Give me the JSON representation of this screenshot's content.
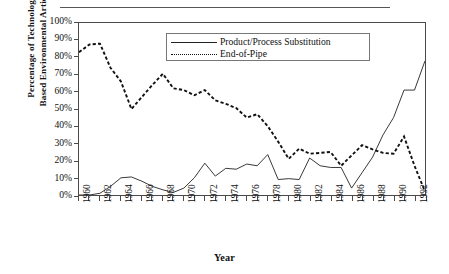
{
  "figure": {
    "top_rule": "horizontal-rule",
    "y_axis_title": "Percentage of Technology\nBased Environmental Articles",
    "x_axis_title": "Year"
  },
  "legend": {
    "position": "top-center-inside",
    "entries": [
      {
        "label": "Product/Process Substitution",
        "style": "solid",
        "key": "solid-line-key"
      },
      {
        "label": "End-of-Pipe",
        "style": "dotted",
        "key": "dotted-line-key"
      }
    ]
  },
  "chart_data": {
    "type": "line",
    "title": "",
    "subtitle": "",
    "xlabel": "Year",
    "ylabel": "Percentage of Technology Based Environmental Articles",
    "xlim": [
      1960,
      1993
    ],
    "ylim": [
      0,
      100
    ],
    "grid": false,
    "legend_position": "upper center",
    "ytick_labels": [
      "0%",
      "10%",
      "20%",
      "30%",
      "40%",
      "50%",
      "60%",
      "70%",
      "80%",
      "90%",
      "100%"
    ],
    "ytick_values": [
      0,
      10,
      20,
      30,
      40,
      50,
      60,
      70,
      80,
      90,
      100
    ],
    "xtick_labels": [
      "1960",
      "1962",
      "1964",
      "1966",
      "1968",
      "1970",
      "1972",
      "1974",
      "1976",
      "1978",
      "1980",
      "1982",
      "1984",
      "1986",
      "1988",
      "1990",
      "1992"
    ],
    "xtick_values": [
      1960,
      1962,
      1964,
      1966,
      1968,
      1970,
      1972,
      1974,
      1976,
      1978,
      1980,
      1982,
      1984,
      1986,
      1988,
      1990,
      1992
    ],
    "minor_xticks_every": 1,
    "x": [
      1960,
      1961,
      1962,
      1963,
      1964,
      1965,
      1966,
      1967,
      1968,
      1969,
      1970,
      1971,
      1972,
      1973,
      1974,
      1975,
      1976,
      1977,
      1978,
      1979,
      1980,
      1981,
      1982,
      1983,
      1984,
      1985,
      1986,
      1987,
      1988,
      1989,
      1990,
      1991,
      1992,
      1993
    ],
    "series": [
      {
        "name": "Product/Process Substitution",
        "style": "solid",
        "color": "#222222",
        "values": [
          0,
          0,
          1,
          5,
          10,
          10.5,
          8,
          5,
          3,
          1.5,
          4,
          10,
          18.5,
          11,
          15.5,
          15,
          18,
          17,
          23.5,
          9,
          9.5,
          9,
          21.5,
          17,
          16,
          16,
          4,
          13,
          22,
          35,
          45,
          61,
          61,
          78
        ]
      },
      {
        "name": "End-of-Pipe",
        "style": "dotted",
        "color": "#111111",
        "values": [
          83,
          87.5,
          88,
          74,
          66,
          50,
          57,
          64,
          70.5,
          62,
          61,
          58,
          61,
          55,
          53,
          50.5,
          45,
          47,
          40,
          31,
          21,
          27,
          24,
          24.5,
          25,
          17,
          23,
          29,
          26.5,
          24.5,
          24,
          34,
          17,
          2
        ]
      }
    ]
  }
}
